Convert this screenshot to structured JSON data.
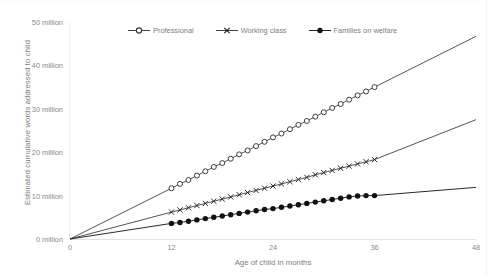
{
  "chart_data": {
    "type": "line",
    "title": "",
    "xlabel": "Age of child in months",
    "ylabel": "Estimated cumulative words addressed to child",
    "xlim": [
      0,
      48
    ],
    "ylim": [
      0,
      50
    ],
    "grid": false,
    "legend_position": "top-center",
    "x_tick_labels": [
      "0",
      "12",
      "24",
      "36",
      "48"
    ],
    "x_ticks": [
      0,
      12,
      24,
      36,
      48
    ],
    "y_tick_labels": [
      "0 million",
      "10 million",
      "20 million",
      "30 million",
      "40 million",
      "50 million"
    ],
    "y_ticks": [
      0,
      10,
      20,
      30,
      40,
      50
    ],
    "y_unit": "million",
    "marker_range_months": [
      12,
      36
    ],
    "series": [
      {
        "name": "Professional",
        "marker": "open-circle",
        "color": "#404040",
        "x": [
          0,
          12,
          13,
          14,
          15,
          16,
          17,
          18,
          19,
          20,
          21,
          22,
          23,
          24,
          25,
          26,
          27,
          28,
          29,
          30,
          31,
          32,
          33,
          34,
          35,
          36,
          48
        ],
        "values": [
          0,
          11.7,
          12.7,
          13.6,
          14.6,
          15.6,
          16.6,
          17.5,
          18.5,
          19.5,
          20.4,
          21.4,
          22.4,
          23.4,
          24.3,
          25.3,
          26.3,
          27.2,
          28.2,
          29.2,
          30.2,
          31.1,
          32.1,
          33.1,
          34.0,
          35.0,
          46.7
        ]
      },
      {
        "name": "Working class",
        "marker": "cross",
        "color": "#404040",
        "x": [
          0,
          12,
          13,
          14,
          15,
          16,
          17,
          18,
          19,
          20,
          21,
          22,
          23,
          24,
          25,
          26,
          27,
          28,
          29,
          30,
          31,
          32,
          33,
          34,
          35,
          36,
          48
        ],
        "values": [
          0,
          6.2,
          6.7,
          7.2,
          7.7,
          8.2,
          8.7,
          9.2,
          9.7,
          10.2,
          10.7,
          11.2,
          11.7,
          12.2,
          12.7,
          13.2,
          13.7,
          14.2,
          14.8,
          15.3,
          15.8,
          16.3,
          16.8,
          17.3,
          17.8,
          18.3,
          27.5
        ]
      },
      {
        "name": "Families on welfare",
        "marker": "filled-circle",
        "color": "#111111",
        "x": [
          0,
          12,
          13,
          14,
          15,
          16,
          17,
          18,
          19,
          20,
          21,
          22,
          23,
          24,
          25,
          26,
          27,
          28,
          29,
          30,
          31,
          32,
          33,
          34,
          35,
          36,
          48
        ],
        "values": [
          0,
          3.6,
          3.8,
          4.1,
          4.4,
          4.7,
          5.0,
          5.3,
          5.6,
          5.9,
          6.2,
          6.5,
          6.8,
          7.0,
          7.3,
          7.6,
          7.9,
          8.2,
          8.5,
          8.8,
          9.1,
          9.4,
          9.7,
          9.9,
          10.0,
          10.0,
          11.9
        ]
      }
    ]
  },
  "legend": {
    "items": [
      {
        "label": "Professional",
        "marker": "open-circle"
      },
      {
        "label": "Working class",
        "marker": "cross"
      },
      {
        "label": "Families on welfare",
        "marker": "filled-circle"
      }
    ]
  },
  "colors": {
    "axis": "#e2e2e2",
    "tick_text": "#8a8a8a",
    "title_text": "#7d7d7d",
    "line_dark": "#404040",
    "line_black": "#111111",
    "background": "#ffffff"
  }
}
